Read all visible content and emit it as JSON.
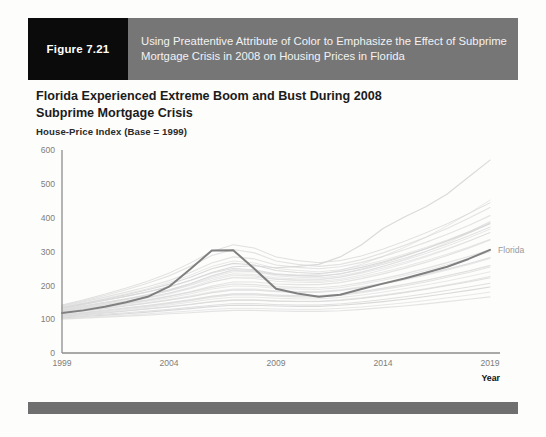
{
  "figure": {
    "number_label": "Figure 7.21",
    "caption": "Using Preattentive Attribute of Color to Emphasize the Effect of Subprime Mortgage Crisis in 2008 on Housing Prices in Florida",
    "number_box_color": "#0b0b0b",
    "caption_box_color": "#767676",
    "footer_bar_color": "#6f6f6f"
  },
  "chart_data": {
    "type": "line",
    "title": "Florida Experienced Extreme Boom and Bust During 2008 Subprime Mortgage Crisis",
    "subtitle": "House-Price Index (Base = 1999)",
    "xlabel": "Year",
    "ylabel": "",
    "xlim": [
      1999,
      2019
    ],
    "ylim": [
      0,
      600
    ],
    "xticks": [
      1999,
      2004,
      2009,
      2014,
      2019
    ],
    "yticks": [
      0,
      100,
      200,
      300,
      400,
      500,
      600
    ],
    "grid": false,
    "legend_position": "right-inline-annotation",
    "highlight_color": "#808080",
    "context_color": "#d8d8d8",
    "annotations": [
      {
        "text": "Florida",
        "x": 2019,
        "y": 305,
        "color": "#9a9a9a"
      }
    ],
    "x": [
      1999,
      2000,
      2001,
      2002,
      2003,
      2004,
      2005,
      2006,
      2007,
      2008,
      2009,
      2010,
      2011,
      2012,
      2013,
      2014,
      2015,
      2016,
      2017,
      2018,
      2019
    ],
    "series": [
      {
        "name": "Florida",
        "highlighted": true,
        "values": [
          118,
          126,
          137,
          150,
          166,
          196,
          248,
          303,
          304,
          248,
          190,
          176,
          166,
          172,
          189,
          205,
          220,
          237,
          255,
          278,
          305
        ]
      },
      {
        "name": "Other state 1",
        "highlighted": false,
        "values": [
          133,
          144,
          156,
          168,
          181,
          196,
          215,
          238,
          255,
          258,
          252,
          256,
          262,
          284,
          320,
          368,
          402,
          432,
          470,
          520,
          570
        ]
      },
      {
        "name": "Other state 2",
        "highlighted": false,
        "values": [
          126,
          136,
          147,
          158,
          170,
          184,
          202,
          224,
          240,
          240,
          232,
          230,
          232,
          244,
          262,
          286,
          312,
          342,
          376,
          412,
          452
        ]
      },
      {
        "name": "Other state 3",
        "highlighted": false,
        "values": [
          122,
          131,
          141,
          151,
          162,
          174,
          190,
          210,
          224,
          224,
          218,
          216,
          216,
          224,
          238,
          256,
          276,
          300,
          326,
          354,
          384
        ]
      },
      {
        "name": "Other state 4",
        "highlighted": false,
        "values": [
          120,
          128,
          137,
          146,
          156,
          167,
          181,
          198,
          210,
          210,
          204,
          202,
          202,
          208,
          220,
          234,
          250,
          268,
          288,
          310,
          334
        ]
      },
      {
        "name": "Other state 5",
        "highlighted": false,
        "values": [
          130,
          140,
          150,
          160,
          172,
          186,
          205,
          228,
          246,
          244,
          232,
          228,
          226,
          234,
          248,
          266,
          286,
          308,
          332,
          358,
          388
        ]
      },
      {
        "name": "Other state 6",
        "highlighted": false,
        "values": [
          116,
          123,
          131,
          139,
          147,
          156,
          166,
          178,
          186,
          186,
          182,
          180,
          180,
          185,
          194,
          205,
          218,
          232,
          248,
          264,
          282
        ]
      },
      {
        "name": "Other state 7",
        "highlighted": false,
        "values": [
          112,
          118,
          124,
          131,
          138,
          146,
          155,
          165,
          172,
          172,
          168,
          166,
          166,
          170,
          178,
          188,
          198,
          210,
          224,
          238,
          254
        ]
      },
      {
        "name": "Other state 8",
        "highlighted": false,
        "values": [
          124,
          133,
          143,
          153,
          164,
          177,
          194,
          215,
          230,
          228,
          218,
          214,
          212,
          218,
          230,
          246,
          264,
          284,
          306,
          330,
          356
        ]
      },
      {
        "name": "Other state 9",
        "highlighted": false,
        "values": [
          108,
          113,
          118,
          124,
          130,
          136,
          143,
          151,
          156,
          156,
          153,
          152,
          152,
          155,
          161,
          169,
          178,
          188,
          199,
          210,
          222
        ]
      },
      {
        "name": "Other state 10",
        "highlighted": false,
        "values": [
          140,
          154,
          170,
          187,
          206,
          228,
          256,
          288,
          306,
          296,
          272,
          262,
          256,
          262,
          276,
          296,
          318,
          342,
          368,
          398,
          430
        ]
      },
      {
        "name": "Other state 11",
        "highlighted": false,
        "values": [
          114,
          120,
          127,
          134,
          141,
          149,
          158,
          168,
          175,
          175,
          171,
          170,
          170,
          174,
          182,
          192,
          203,
          215,
          229,
          243,
          259
        ]
      },
      {
        "name": "Other state 12",
        "highlighted": false,
        "values": [
          136,
          148,
          161,
          175,
          190,
          208,
          230,
          256,
          272,
          266,
          250,
          244,
          240,
          246,
          258,
          274,
          292,
          312,
          334,
          358,
          384
        ]
      },
      {
        "name": "Other state 13",
        "highlighted": false,
        "values": [
          104,
          108,
          112,
          116,
          121,
          126,
          131,
          137,
          141,
          141,
          139,
          138,
          138,
          141,
          146,
          152,
          159,
          167,
          176,
          185,
          195
        ]
      },
      {
        "name": "Other state 14",
        "highlighted": false,
        "values": [
          128,
          138,
          149,
          160,
          173,
          187,
          205,
          228,
          244,
          240,
          228,
          224,
          222,
          228,
          240,
          256,
          274,
          294,
          316,
          340,
          366
        ]
      },
      {
        "name": "Other state 15",
        "highlighted": false,
        "values": [
          118,
          125,
          133,
          141,
          149,
          158,
          169,
          181,
          189,
          189,
          184,
          182,
          182,
          187,
          196,
          207,
          219,
          233,
          248,
          264,
          282
        ]
      },
      {
        "name": "Other state 16",
        "highlighted": false,
        "values": [
          100,
          103,
          106,
          109,
          112,
          116,
          119,
          123,
          126,
          126,
          124,
          123,
          123,
          125,
          129,
          134,
          139,
          145,
          152,
          159,
          166
        ]
      },
      {
        "name": "Other state 17",
        "highlighted": false,
        "values": [
          132,
          143,
          155,
          167,
          180,
          195,
          214,
          236,
          250,
          246,
          234,
          230,
          228,
          234,
          246,
          262,
          280,
          300,
          322,
          346,
          372
        ]
      },
      {
        "name": "Other state 18",
        "highlighted": false,
        "values": [
          110,
          116,
          122,
          128,
          135,
          142,
          150,
          159,
          165,
          165,
          162,
          160,
          160,
          164,
          171,
          180,
          190,
          201,
          213,
          226,
          240
        ]
      },
      {
        "name": "Other state 19",
        "highlighted": false,
        "values": [
          122,
          130,
          139,
          148,
          157,
          168,
          180,
          194,
          204,
          202,
          196,
          194,
          193,
          198,
          208,
          220,
          234,
          250,
          267,
          285,
          305
        ]
      },
      {
        "name": "Other state 20",
        "highlighted": false,
        "values": [
          127,
          137,
          147,
          158,
          170,
          183,
          200,
          220,
          234,
          232,
          222,
          219,
          218,
          224,
          236,
          251,
          268,
          287,
          308,
          331,
          356
        ]
      },
      {
        "name": "Other state 21",
        "highlighted": false,
        "values": [
          106,
          110,
          115,
          119,
          124,
          129,
          135,
          141,
          146,
          146,
          143,
          142,
          142,
          145,
          151,
          158,
          166,
          175,
          185,
          195,
          206
        ]
      },
      {
        "name": "Other state 22",
        "highlighted": false,
        "values": [
          138,
          151,
          165,
          180,
          196,
          214,
          238,
          266,
          284,
          278,
          260,
          253,
          249,
          255,
          268,
          285,
          305,
          327,
          351,
          377,
          406
        ]
      },
      {
        "name": "Other state 23",
        "highlighted": false,
        "values": [
          117,
          124,
          131,
          139,
          147,
          156,
          166,
          178,
          186,
          186,
          181,
          179,
          179,
          184,
          193,
          204,
          216,
          230,
          245,
          261,
          279
        ]
      },
      {
        "name": "Other state 24",
        "highlighted": false,
        "values": [
          102,
          105,
          109,
          112,
          116,
          120,
          124,
          129,
          132,
          132,
          130,
          129,
          129,
          132,
          136,
          142,
          148,
          155,
          163,
          171,
          180
        ]
      },
      {
        "name": "Other state 25",
        "highlighted": false,
        "values": [
          134,
          146,
          159,
          172,
          187,
          203,
          224,
          249,
          265,
          260,
          244,
          238,
          235,
          241,
          253,
          269,
          288,
          308,
          331,
          355,
          382
        ]
      },
      {
        "name": "Other state 26",
        "highlighted": false,
        "values": [
          113,
          119,
          126,
          133,
          140,
          148,
          157,
          168,
          175,
          175,
          171,
          169,
          169,
          173,
          181,
          191,
          202,
          214,
          228,
          242,
          258
        ]
      },
      {
        "name": "Other state 27",
        "highlighted": false,
        "values": [
          125,
          134,
          144,
          154,
          165,
          177,
          192,
          210,
          222,
          220,
          212,
          209,
          208,
          214,
          225,
          239,
          255,
          273,
          292,
          313,
          336
        ]
      },
      {
        "name": "Other state 28",
        "highlighted": false,
        "values": [
          109,
          114,
          120,
          125,
          131,
          137,
          144,
          152,
          157,
          157,
          154,
          153,
          153,
          157,
          163,
          171,
          180,
          190,
          201,
          213,
          226
        ]
      },
      {
        "name": "Other state 29",
        "highlighted": false,
        "values": [
          142,
          157,
          174,
          192,
          212,
          236,
          266,
          300,
          320,
          310,
          284,
          273,
          267,
          273,
          287,
          307,
          330,
          355,
          382,
          412,
          444
        ]
      },
      {
        "name": "Other state 30",
        "highlighted": false,
        "values": [
          119,
          127,
          135,
          144,
          153,
          163,
          175,
          189,
          198,
          197,
          191,
          189,
          188,
          193,
          203,
          215,
          229,
          244,
          261,
          279,
          299
        ]
      }
    ]
  }
}
